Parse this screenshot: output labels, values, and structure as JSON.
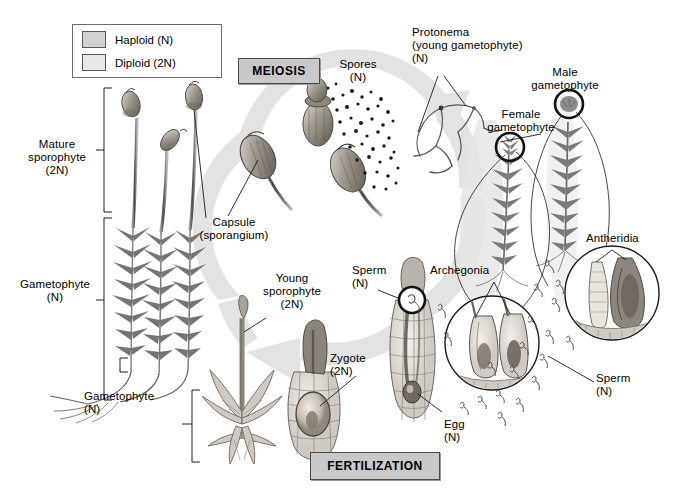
{
  "diagram": {
    "legend": {
      "haploid_label": "Haploid (N)",
      "diploid_label": "Diploid (2N)",
      "haploid_color": "#d2d2d2",
      "diploid_color": "#e8e8e8"
    },
    "stage_boxes": [
      {
        "label": "MEIOSIS"
      },
      {
        "label": "FERTILIZATION"
      }
    ],
    "labels": {
      "mature_sporophyte": "Mature\nsporophyte\n(2N)",
      "gametophyte_left": "Gametophyte\n(N)",
      "capsule": "Capsule\n(sporangium)",
      "spores": "Spores\n(N)",
      "protonema": "Protonema\n(young gametophyte)\n(N)",
      "male_gametophyte": "Male\ngametophyte",
      "female_gametophyte": "Female\ngametophyte",
      "antheridia": "Antheridia",
      "archegonia": "Archegonia",
      "sperm_left": "Sperm\n(N)",
      "sperm_right": "Sperm\n(N)",
      "young_sporophyte": "Young\nsporophyte\n(2N)",
      "gametophyte_bottom": "Gametophyte\n(N)",
      "zygote": "Zygote\n(2N)",
      "egg": "Egg\n(N)"
    },
    "colors": {
      "cycle_arrow": "#e3e3e3",
      "stage_box_fill": "#c9c9c9",
      "stage_box_border": "#4a4a4a",
      "ink": "#000000"
    }
  }
}
